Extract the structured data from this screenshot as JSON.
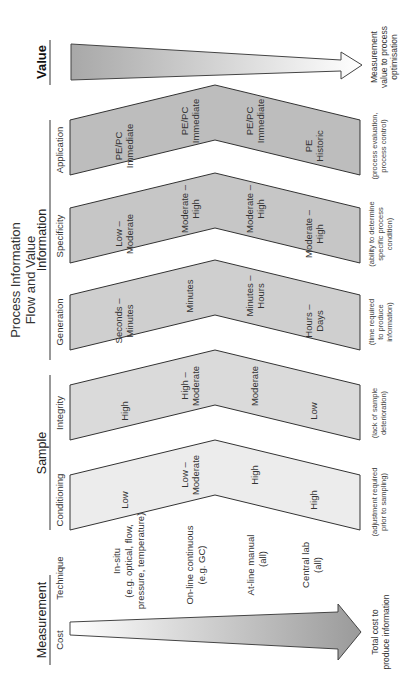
{
  "title": {
    "line1": "Process Information",
    "line2": "Flow and Value"
  },
  "groups": {
    "measurement": "Measurement",
    "sample": "Sample",
    "information": "Information",
    "value": "Value"
  },
  "columns": {
    "cost": "Cost",
    "technique": "Technique",
    "conditioning": "Conditioning",
    "integrity": "Integrity",
    "generation": "Generation",
    "specificity": "Specificity",
    "application": "Application"
  },
  "techniques": [
    {
      "line1": "In-situ",
      "line2": "(e.g. optical, flow,",
      "line3": "pressure, temperature)"
    },
    {
      "line1": "On-line continuous",
      "line2": "(e.g. GC)"
    },
    {
      "line1": "At-line  manual",
      "line2": "(all)"
    },
    {
      "line1": "Central lab",
      "line2": "(all)"
    }
  ],
  "chevrons": {
    "conditioning": {
      "color": "#ececec",
      "values": [
        {
          "line1": "Low"
        },
        {
          "line1": "Low –",
          "line2": "Moderate"
        },
        {
          "line1": "High"
        },
        {
          "line1": "High"
        }
      ],
      "desc": {
        "line1": "(adjustment required",
        "line2": "prior to sampling)"
      }
    },
    "integrity": {
      "color": "#dadada",
      "values": [
        {
          "line1": "High"
        },
        {
          "line1": "High –",
          "line2": "Moderate"
        },
        {
          "line1": "Moderate"
        },
        {
          "line1": "Low"
        }
      ],
      "desc": {
        "line1": "(lack of sample",
        "line2": "deterioration)"
      }
    },
    "generation": {
      "color": "#cfcfcf",
      "values": [
        {
          "line1": "Seconds –",
          "line2": "Minutes"
        },
        {
          "line1": "Minutes"
        },
        {
          "line1": "Minutes –",
          "line2": "Hours"
        },
        {
          "line1": "Hours –",
          "line2": "Days"
        }
      ],
      "desc": {
        "line1": "(time required",
        "line2": "to produce",
        "line3": "information)"
      }
    },
    "specificity": {
      "color": "#c6c6c6",
      "values": [
        {
          "line1": "Low –",
          "line2": "Moderate"
        },
        {
          "line1": "Moderate –",
          "line2": "High"
        },
        {
          "line1": "Moderate –",
          "line2": "High"
        },
        {
          "line1": "Moderate –",
          "line2": "High"
        }
      ],
      "desc": {
        "line1": "(ability to determine",
        "line2": "specific process",
        "line3": "condition)"
      }
    },
    "application": {
      "color": "#bdbdbd",
      "values": [
        {
          "line1": "PE/PC",
          "line2": "Immediate"
        },
        {
          "line1": "PE/PC",
          "line2": "Immediate"
        },
        {
          "line1": "PE/PC",
          "line2": "Immediate"
        },
        {
          "line1": "PE",
          "line2": "Historic"
        }
      ],
      "desc": {
        "line1": "(process evaluation,",
        "line2": "process control)"
      }
    }
  },
  "arrows": {
    "cost": {
      "line1": "Total cost to",
      "line2": "produce information",
      "color": "#9a9a9a"
    },
    "value": {
      "line1": "Measurement",
      "line2": "value to process",
      "line3": "optimisation",
      "color": "#9a9a9a"
    }
  }
}
